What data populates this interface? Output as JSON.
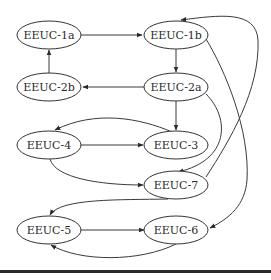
{
  "diagram": {
    "type": "directed-graph",
    "nodes": [
      {
        "id": "n1a",
        "label": "EEUC-1a",
        "cx": 49,
        "cy": 35
      },
      {
        "id": "n1b",
        "label": "EEUC-1b",
        "cx": 176,
        "cy": 35
      },
      {
        "id": "n2b",
        "label": "EEUC-2b",
        "cx": 49,
        "cy": 87
      },
      {
        "id": "n2a",
        "label": "EEUC-2a",
        "cx": 176,
        "cy": 87
      },
      {
        "id": "n4",
        "label": "EEUC-4",
        "cx": 49,
        "cy": 145
      },
      {
        "id": "n3",
        "label": "EEUC-3",
        "cx": 176,
        "cy": 145
      },
      {
        "id": "n7",
        "label": "EEUC-7",
        "cx": 176,
        "cy": 185
      },
      {
        "id": "n5",
        "label": "EEUC-5",
        "cx": 49,
        "cy": 230
      },
      {
        "id": "n6",
        "label": "EEUC-6",
        "cx": 176,
        "cy": 230
      }
    ],
    "edges": [
      {
        "from": "EEUC-1a",
        "to": "EEUC-1b"
      },
      {
        "from": "EEUC-1b",
        "to": "EEUC-2a"
      },
      {
        "from": "EEUC-2a",
        "to": "EEUC-2b"
      },
      {
        "from": "EEUC-2b",
        "to": "EEUC-1a"
      },
      {
        "from": "EEUC-2a",
        "to": "EEUC-3"
      },
      {
        "from": "EEUC-3",
        "to": "EEUC-4"
      },
      {
        "from": "EEUC-4",
        "to": "EEUC-3"
      },
      {
        "from": "EEUC-4",
        "to": "EEUC-7"
      },
      {
        "from": "EEUC-2a",
        "to": "EEUC-7"
      },
      {
        "from": "EEUC-7",
        "to": "EEUC-1b"
      },
      {
        "from": "EEUC-1b",
        "to": "EEUC-6"
      },
      {
        "from": "EEUC-7",
        "to": "EEUC-5"
      },
      {
        "from": "EEUC-5",
        "to": "EEUC-6"
      },
      {
        "from": "EEUC-6",
        "to": "EEUC-5"
      }
    ]
  }
}
